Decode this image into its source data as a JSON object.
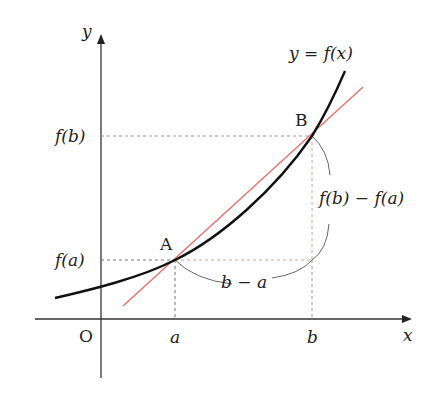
{
  "diagram": {
    "axes": {
      "x_label": "x",
      "y_label": "y",
      "origin_label": "O"
    },
    "curve_label": "y = f(x)",
    "points": [
      {
        "name": "A",
        "x_label": "a",
        "y_label": "f(a)"
      },
      {
        "name": "B",
        "x_label": "b",
        "y_label": "f(b)"
      }
    ],
    "annotations": {
      "horizontal_difference": "b − a",
      "vertical_difference": "f(b) − f(a)"
    },
    "colors": {
      "curve": "#111111",
      "secant_line": "#e8706e",
      "axes": "#333333",
      "dashed_guides": "#888888",
      "dashed_guides_red": "#e89a9a"
    }
  }
}
